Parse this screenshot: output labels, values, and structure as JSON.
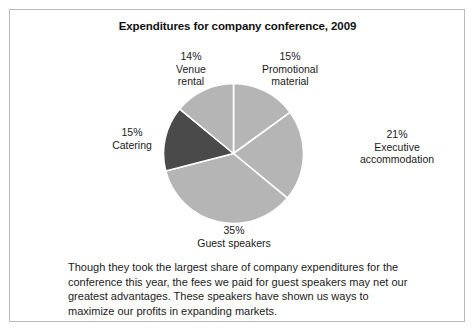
{
  "figure": {
    "title": "Expenditures for company conference, 2009",
    "border_color": "#b9b9b9",
    "background": "#ffffff"
  },
  "caption": {
    "text": "Though they took the largest share of company expenditures for the conference this year, the fees we paid for guest speakers may net our greatest  advantages. These speakers have shown us ways to maximize our profits in expanding markets."
  },
  "labels": {
    "venue": "14%\nVenue\nrental",
    "promotional": "15%\nPromotional\nmaterial",
    "executive": "21%\nExecutive\naccommodation",
    "catering": "15%\nCatering",
    "guest": "35%\nGuest speakers"
  },
  "chart_data": {
    "type": "pie",
    "title": "Expenditures for company conference, 2009",
    "xlabel": "",
    "ylabel": "",
    "categories": [
      "Promotional material",
      "Executive accommodation",
      "Guest speakers",
      "Catering",
      "Venue rental"
    ],
    "values": [
      15,
      21,
      35,
      15,
      14
    ],
    "value_unit": "%",
    "data_labels": [
      "15%",
      "21%",
      "35%",
      "15%",
      "14%"
    ],
    "colors": [
      "#b5b5b5",
      "#b5b5b5",
      "#b5b5b5",
      "#4a4a4a",
      "#b5b5b5"
    ],
    "slice_separator_color": "#ffffff",
    "start_angle_deg": 0,
    "direction": "clockwise",
    "legend": "none",
    "grid": false,
    "annotations": [
      "Though they took the largest share of company expenditures for the conference this year, the fees we paid for guest speakers may net our greatest  advantages. These speakers have shown us ways to maximize our profits in expanding markets."
    ]
  }
}
